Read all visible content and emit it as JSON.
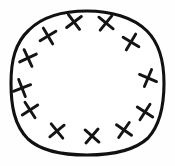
{
  "figure": {
    "type": "hand-drawn-diagram",
    "background_color": "#fefefe",
    "ink_color": "#111111",
    "interior_fill": "#ffffff",
    "canvas": {
      "width": 175,
      "height": 166
    },
    "outline": {
      "name": "hand-drawn-circle",
      "stroke_width": 3.1,
      "bounds": {
        "left": 11,
        "top": 11,
        "right": 164,
        "bottom": 155
      },
      "center": {
        "x": 87,
        "y": 83
      },
      "radius_x": 76,
      "radius_y": 72,
      "path": "M 87 11 C 110 11 133 17 147 31 C 160 44 164 62 164 83 C 164 104 161 124 148 138 C 134 151 111 155 87 155 C 64 155 42 152 28 139 C 14 125 11 105 11 83 C 11 61 15 43 29 30 C 43 16 64 11 87 11 Z"
    },
    "marks": {
      "name": "cross-marks",
      "glyph": "x",
      "count": 12,
      "stroke_width": 2.9,
      "size": 13,
      "items": [
        {
          "label": "mark-1",
          "x": 74,
          "y": 22,
          "rotation": 8
        },
        {
          "label": "mark-2",
          "x": 106,
          "y": 23,
          "rotation": -6
        },
        {
          "label": "mark-3",
          "x": 48,
          "y": 36,
          "rotation": 14
        },
        {
          "label": "mark-4",
          "x": 131,
          "y": 42,
          "rotation": -14
        },
        {
          "label": "mark-5",
          "x": 28,
          "y": 58,
          "rotation": 20
        },
        {
          "label": "mark-6",
          "x": 148,
          "y": 78,
          "rotation": -22
        },
        {
          "label": "mark-7",
          "x": 22,
          "y": 88,
          "rotation": 24
        },
        {
          "label": "mark-8",
          "x": 30,
          "y": 110,
          "rotation": 12
        },
        {
          "label": "mark-9",
          "x": 145,
          "y": 112,
          "rotation": -12
        },
        {
          "label": "mark-10",
          "x": 57,
          "y": 131,
          "rotation": 6
        },
        {
          "label": "mark-11",
          "x": 92,
          "y": 136,
          "rotation": -4
        },
        {
          "label": "mark-12",
          "x": 124,
          "y": 130,
          "rotation": -10
        }
      ]
    }
  }
}
